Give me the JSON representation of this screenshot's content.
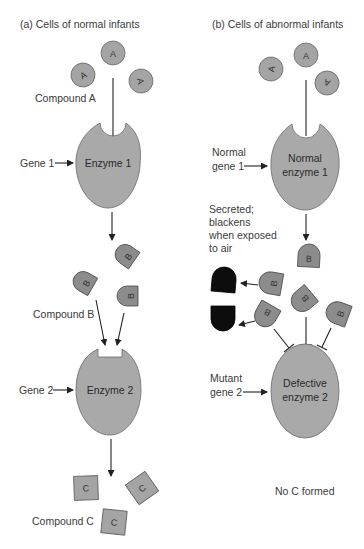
{
  "panel_a": {
    "title": "(a)  Cells of normal infants",
    "compound_a_label": "Compound A",
    "gene1_label": "Gene 1",
    "enzyme1_label": "Enzyme 1",
    "compound_b_label": "Compound B",
    "gene2_label": "Gene 2",
    "enzyme2_label": "Enzyme 2",
    "compound_c_label": "Compound C",
    "molecule_a": "A",
    "molecule_b": "B",
    "molecule_c": "C"
  },
  "panel_b": {
    "title": "(b)  Cells of abnormal infants",
    "normal_gene1_line1": "Normal",
    "normal_gene1_line2": "gene 1",
    "enzyme1_line1": "Normal",
    "enzyme1_line2": "enzyme 1",
    "secreted_line1": "Secreted;",
    "secreted_line2": "blackens",
    "secreted_line3": "when exposed",
    "secreted_line4": "to air",
    "mutant_gene2_line1": "Mutant",
    "mutant_gene2_line2": "gene 2",
    "enzyme2_line1": "Defective",
    "enzyme2_line2": "enzyme 2",
    "no_c_label": "No C formed",
    "molecule_a": "A",
    "molecule_b": "B"
  },
  "colors": {
    "enzyme_fill": "#a9a9a9",
    "compound_b_fill": "#8c8c8c",
    "blackened_fill": "#0d0d0d",
    "text": "#3a3a3a"
  }
}
